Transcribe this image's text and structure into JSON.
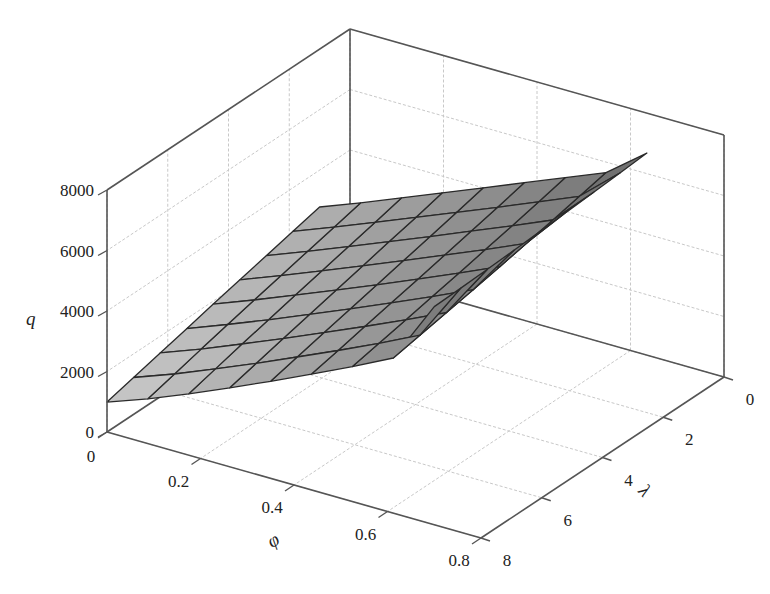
{
  "chart_data": {
    "type": "surface",
    "title": "",
    "xlabel": "φ",
    "ylabel": "λ",
    "zlabel": "q",
    "x_ticks": [
      "0",
      "0.2",
      "0.4",
      "0.6",
      "0.8"
    ],
    "y_ticks": [
      "0",
      "2",
      "4",
      "6",
      "8"
    ],
    "z_ticks": [
      "0",
      "2000",
      "4000",
      "6000",
      "8000"
    ],
    "xlim": [
      0,
      0.8
    ],
    "ylim": [
      0,
      8
    ],
    "zlim": [
      0,
      8000
    ],
    "grid": true,
    "legend": null,
    "phi": [
      0,
      0.0875,
      0.175,
      0.2625,
      0.35,
      0.4375,
      0.525,
      0.6125,
      0.7
    ],
    "lambda": [
      1,
      1.875,
      2.75,
      3.625,
      4.5,
      5.375,
      6.25,
      7.125,
      8
    ],
    "q": [
      [
        2780,
        3300,
        3850,
        4400,
        4950,
        5500,
        6050,
        6600,
        7630
      ],
      [
        2560,
        3080,
        3620,
        4170,
        4720,
        5270,
        5830,
        6400,
        7560
      ],
      [
        2340,
        2860,
        3400,
        3950,
        4500,
        5060,
        5620,
        6200,
        7500
      ],
      [
        2120,
        2640,
        3180,
        3730,
        4290,
        4850,
        5420,
        6010,
        7440
      ],
      [
        1900,
        2420,
        2960,
        3510,
        4070,
        4640,
        5220,
        5820,
        7380
      ],
      [
        1670,
        2190,
        2730,
        3290,
        3860,
        4440,
        5030,
        5640,
        7330
      ],
      [
        1450,
        1960,
        2510,
        3070,
        3650,
        4240,
        4840,
        5470,
        7280
      ],
      [
        1220,
        1720,
        2270,
        2840,
        3430,
        4030,
        4650,
        5300,
        7240
      ],
      [
        990,
        1480,
        2030,
        2610,
        3210,
        3830,
        4460,
        5130,
        7210
      ]
    ]
  },
  "axes": {
    "q_label": "q",
    "phi_label": "φ",
    "lambda_label": "λ"
  },
  "colors": {
    "box": "#555555",
    "grid": "#c8c8c8",
    "mesh_edge": "#2a2a2a",
    "surface_light": "#c9c9c9",
    "surface_dark": "#6a6a6a"
  }
}
